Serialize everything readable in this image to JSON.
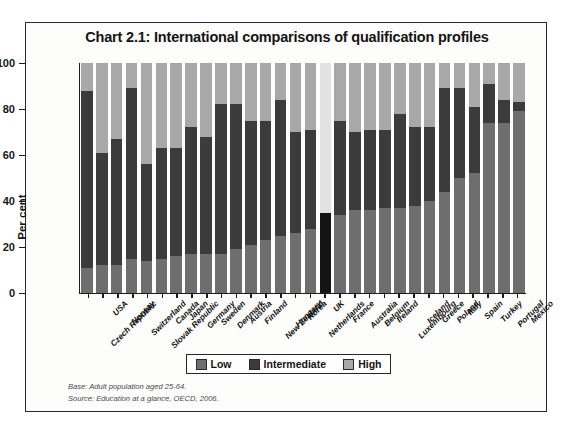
{
  "figure": {
    "title": "Chart 2.1: International comparisons of qualification profiles"
  },
  "axes": {
    "ylabel": "Per cent",
    "yticks": [
      "100",
      "80",
      "60",
      "40",
      "20",
      "0"
    ]
  },
  "legend": {
    "items": [
      {
        "label": "Low",
        "color": "#6e6e6e"
      },
      {
        "label": "Intermediate",
        "color": "#3b3b3b"
      },
      {
        "label": "High",
        "color": "#a8a8a8"
      }
    ]
  },
  "notes": {
    "base": "Base: Adult population aged 25-64.",
    "source": "Source: Education at a glance, OECD, 2006."
  },
  "chart_data": {
    "type": "bar",
    "title": "Chart 2.1: International comparisons of qualification profiles",
    "subtype": "stacked-100-percent",
    "xlabel": "",
    "ylabel": "Per cent",
    "ylim": [
      0,
      100
    ],
    "yticks": [
      0,
      20,
      40,
      60,
      80,
      100
    ],
    "grid": false,
    "legend_position": "bottom",
    "categories": [
      "Czech Republic",
      "USA",
      "Norway",
      "Switzerland",
      "Slovak Republic",
      "Canada",
      "Japan",
      "Germany",
      "Sweden",
      "Denmark",
      "Austria",
      "Finland",
      "New Zealand",
      "Hungary",
      "Korea",
      "Netherlands",
      "UK",
      "France",
      "Australia",
      "Belgium",
      "Ireland",
      "Luxembourg",
      "Iceland",
      "Greece",
      "Poland",
      "Italy",
      "Spain",
      "Turkey",
      "Portugal",
      "Mexico"
    ],
    "series": [
      {
        "name": "Low",
        "color": "#6e6e6e",
        "values": [
          11,
          12,
          12,
          15,
          14,
          15,
          16,
          17,
          17,
          17,
          19,
          21,
          23,
          25,
          26,
          28,
          35,
          34,
          36,
          36,
          37,
          37,
          38,
          40,
          44,
          50,
          52,
          74,
          74,
          79
        ]
      },
      {
        "name": "Intermediate",
        "color": "#3b3b3b",
        "values": [
          77,
          49,
          55,
          74,
          42,
          48,
          47,
          55,
          51,
          65,
          63,
          54,
          52,
          59,
          44,
          43,
          65,
          41,
          34,
          35,
          34,
          41,
          34,
          32,
          45,
          39,
          29,
          17,
          10,
          4
        ]
      },
      {
        "name": "High",
        "color": "#a8a8a8",
        "values": [
          12,
          39,
          33,
          11,
          44,
          37,
          37,
          28,
          32,
          18,
          18,
          25,
          25,
          16,
          30,
          29,
          0,
          25,
          30,
          29,
          29,
          22,
          28,
          28,
          11,
          11,
          19,
          9,
          16,
          17
        ]
      }
    ],
    "bar_tops": {
      "note": "cumulative tops of Low+Intermediate (top of dark band)",
      "values": [
        88,
        61,
        67,
        89,
        56,
        63,
        63,
        72,
        68,
        82,
        82,
        75,
        75,
        84,
        70,
        71,
        100,
        75,
        70,
        71,
        71,
        78,
        72,
        72,
        89,
        89,
        81,
        91,
        84,
        83
      ]
    }
  }
}
